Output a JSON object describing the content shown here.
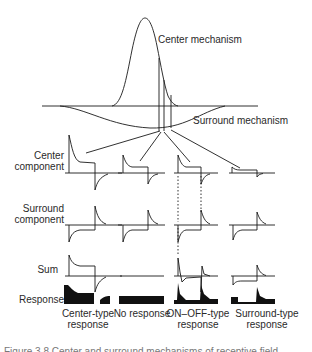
{
  "figure": {
    "top_labels": {
      "center_mechanism": "Center mechanism",
      "surround_mechanism": "Surround mechanism"
    },
    "row_labels": [
      {
        "line1": "Center",
        "line2": "component"
      },
      {
        "line1": "Surround",
        "line2": "component"
      },
      {
        "line1": "Sum",
        "line2": ""
      },
      {
        "line1": "Response",
        "line2": ""
      }
    ],
    "column_labels": [
      {
        "line1": "Center-type",
        "line2": "response"
      },
      {
        "line1": "No response",
        "line2": ""
      },
      {
        "line1": "ON–OFF-type",
        "line2": "response"
      },
      {
        "line1": "Surround-type",
        "line2": "response"
      }
    ],
    "caption_fragment": "Figure 3.8  Center and surround mechanisms of receptive field"
  },
  "colors": {
    "ink": "#1a1a1a",
    "label": "#2a2a2a",
    "background": "#ffffff"
  }
}
